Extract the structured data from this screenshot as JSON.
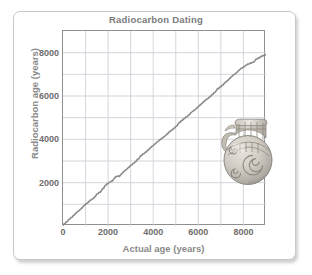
{
  "figure": {
    "background_color": "#ffffff",
    "card_border_color": "#c9c9c9"
  },
  "illustration": {
    "name": "ancient-ceramic-pot",
    "description": "Decorated ancient ceramic pot with spiral motifs and handles"
  },
  "chart_data": {
    "type": "line",
    "title": "Radiocarbon Dating",
    "xlabel": "Actual age  (years)",
    "ylabel": "Radiocarbon age  (years)",
    "xlim": [
      0,
      9000
    ],
    "ylim": [
      0,
      9000
    ],
    "grid": true,
    "grid_color": "#d0d0d8",
    "axis_color": "#8f8f8f",
    "line_color": "#8a8a8a",
    "legend": null,
    "xticks": [
      0,
      2000,
      4000,
      6000,
      8000
    ],
    "xtick_labels": [
      "0",
      "2000",
      "4000",
      "6000",
      "8000"
    ],
    "yticks": [
      2000,
      4000,
      6000,
      8000
    ],
    "ytick_labels": [
      "2000",
      "4000",
      "6000",
      "8000"
    ],
    "xgridlines": [
      0,
      1000,
      2000,
      3000,
      4000,
      5000,
      6000,
      7000,
      8000,
      9000
    ],
    "ygridlines": [
      0,
      1000,
      2000,
      3000,
      4000,
      5000,
      6000,
      7000,
      8000,
      9000
    ],
    "series": [
      {
        "name": "Radiocarbon calibration curve",
        "x": [
          0,
          100,
          200,
          300,
          400,
          500,
          600,
          700,
          800,
          900,
          1000,
          1100,
          1200,
          1300,
          1400,
          1500,
          1600,
          1700,
          1800,
          1900,
          2000,
          2100,
          2200,
          2300,
          2400,
          2500,
          2600,
          2700,
          2800,
          2900,
          3000,
          3100,
          3200,
          3300,
          3400,
          3500,
          3600,
          3700,
          3800,
          3900,
          4000,
          4100,
          4200,
          4300,
          4400,
          4500,
          4600,
          4700,
          4800,
          4900,
          5000,
          5100,
          5200,
          5300,
          5400,
          5500,
          5600,
          5700,
          5800,
          5900,
          6000,
          6100,
          6200,
          6300,
          6400,
          6500,
          6600,
          6700,
          6800,
          6900,
          7000,
          7100,
          7200,
          7300,
          7400,
          7500,
          7600,
          7700,
          7800,
          7900,
          8000,
          8100,
          8200,
          8300,
          8400,
          8500,
          8600,
          8700,
          8800,
          8900,
          9000
        ],
        "y": [
          0,
          120,
          210,
          320,
          400,
          500,
          620,
          700,
          790,
          900,
          1010,
          1080,
          1190,
          1250,
          1340,
          1480,
          1560,
          1620,
          1740,
          1880,
          1950,
          2030,
          2080,
          2230,
          2300,
          2290,
          2410,
          2520,
          2600,
          2700,
          2800,
          2880,
          2960,
          3080,
          3170,
          3260,
          3340,
          3420,
          3520,
          3630,
          3710,
          3800,
          3900,
          3980,
          4060,
          4140,
          4230,
          4340,
          4420,
          4500,
          4600,
          4700,
          4790,
          4880,
          4960,
          5040,
          5130,
          5250,
          5320,
          5410,
          5510,
          5600,
          5700,
          5800,
          5880,
          5960,
          6060,
          6160,
          6260,
          6340,
          6420,
          6510,
          6620,
          6700,
          6810,
          6920,
          7000,
          7080,
          7190,
          7280,
          7330,
          7420,
          7480,
          7520,
          7560,
          7620,
          7700,
          7750,
          7820,
          7860,
          7900
        ]
      }
    ]
  }
}
